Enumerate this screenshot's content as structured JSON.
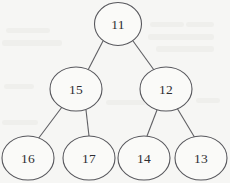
{
  "figure": {
    "kind": "binary-tree-diagram",
    "background_color": "#f6f6f4",
    "node_fill_color": "#fafaf8",
    "node_stroke_color": "#57575c",
    "edge_stroke_color": "#5f5f63",
    "label_color": "#2e2e32"
  },
  "tree": {
    "root_id": "n11",
    "nodes": [
      {
        "id": "n11",
        "label": "11",
        "cx": 118,
        "cy": 24,
        "rx": 23.5,
        "ry": 21.5,
        "level": 0
      },
      {
        "id": "n15",
        "label": "15",
        "cx": 76,
        "cy": 89,
        "rx": 26,
        "ry": 22,
        "level": 1
      },
      {
        "id": "n12",
        "label": "12",
        "cx": 166,
        "cy": 89,
        "rx": 26,
        "ry": 22,
        "level": 1
      },
      {
        "id": "n16",
        "label": "16",
        "cx": 28,
        "cy": 158,
        "rx": 26,
        "ry": 22,
        "level": 2
      },
      {
        "id": "n17",
        "label": "17",
        "cx": 89,
        "cy": 158,
        "rx": 26,
        "ry": 22,
        "level": 2
      },
      {
        "id": "n14",
        "label": "14",
        "cx": 144,
        "cy": 158,
        "rx": 26,
        "ry": 22,
        "level": 2
      },
      {
        "id": "n13",
        "label": "13",
        "cx": 201,
        "cy": 158,
        "rx": 26,
        "ry": 22,
        "level": 2
      }
    ],
    "edges": [
      {
        "id": "e-11-15",
        "from": "n11",
        "to": "n15",
        "x1": 103,
        "y1": 41,
        "x2": 88,
        "y2": 70
      },
      {
        "id": "e-11-12",
        "from": "n11",
        "to": "n12",
        "x1": 133,
        "y1": 41,
        "x2": 154,
        "y2": 70
      },
      {
        "id": "e-15-16",
        "from": "n15",
        "to": "n16",
        "x1": 62,
        "y1": 107,
        "x2": 38,
        "y2": 139
      },
      {
        "id": "e-15-17",
        "from": "n15",
        "to": "n17",
        "x1": 86,
        "y1": 110,
        "x2": 89,
        "y2": 136
      },
      {
        "id": "e-12-14",
        "from": "n12",
        "to": "n14",
        "x1": 157,
        "y1": 110,
        "x2": 147,
        "y2": 136
      },
      {
        "id": "e-12-13",
        "from": "n12",
        "to": "n13",
        "x1": 177,
        "y1": 108,
        "x2": 195,
        "y2": 138
      }
    ]
  },
  "background_smudges": [
    {
      "left": 6,
      "top": 28,
      "width": 44,
      "height": 5
    },
    {
      "left": 2,
      "top": 40,
      "width": 60,
      "height": 6
    },
    {
      "left": 150,
      "top": 22,
      "width": 34,
      "height": 5
    },
    {
      "left": 186,
      "top": 22,
      "width": 28,
      "height": 5
    },
    {
      "left": 148,
      "top": 34,
      "width": 66,
      "height": 6
    },
    {
      "left": 156,
      "top": 46,
      "width": 58,
      "height": 6
    },
    {
      "left": 4,
      "top": 84,
      "width": 30,
      "height": 5
    },
    {
      "left": 106,
      "top": 100,
      "width": 40,
      "height": 5
    },
    {
      "left": 2,
      "top": 120,
      "width": 36,
      "height": 5
    },
    {
      "left": 196,
      "top": 98,
      "width": 24,
      "height": 5
    }
  ]
}
